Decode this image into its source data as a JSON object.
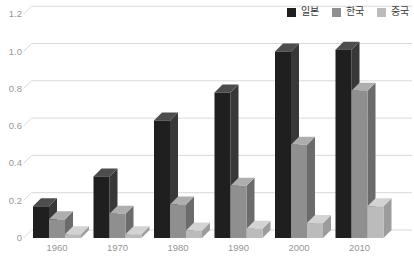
{
  "chart_data": {
    "type": "bar",
    "variant": "3d-column",
    "title": "",
    "xlabel": "",
    "ylabel": "",
    "categories": [
      "1960",
      "1970",
      "1980",
      "1990",
      "2000",
      "2010"
    ],
    "series": [
      {
        "name": "일본",
        "key": "japan",
        "color": "#1f1f1f",
        "top_color": "#4d4d4d",
        "side_color": "#383838",
        "values": [
          0.17,
          0.33,
          0.63,
          0.78,
          1.0,
          1.01
        ]
      },
      {
        "name": "한국",
        "key": "korea",
        "color": "#8f8f8f",
        "top_color": "#aeaeae",
        "side_color": "#6b6b6b",
        "values": [
          0.1,
          0.13,
          0.18,
          0.28,
          0.5,
          0.79
        ]
      },
      {
        "name": "중국",
        "key": "china",
        "color": "#bbbbbb",
        "top_color": "#d3d3d3",
        "side_color": "#9c9c9c",
        "values": [
          0.02,
          0.02,
          0.04,
          0.05,
          0.08,
          0.17
        ]
      }
    ],
    "yticks": [
      "0",
      "0.2",
      "0.4",
      "0.6",
      "0.8",
      "1.0",
      "1.2"
    ],
    "ylim": [
      0,
      1.2
    ],
    "grid": true,
    "gridline_color": "#d9d9d9",
    "axis_text_color": "#969696",
    "legend_position": "top-right",
    "legend_text_color": "#3a3a3a",
    "background": "#ffffff"
  }
}
